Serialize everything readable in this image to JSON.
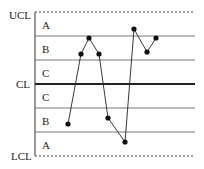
{
  "chart_data": {
    "type": "line",
    "title": "",
    "xlabel": "",
    "ylabel": "",
    "control_lines": [
      {
        "name": "UCL",
        "y": 12,
        "style": "dashed"
      },
      {
        "name": "CL",
        "y": 84,
        "style": "thick"
      },
      {
        "name": "LCL",
        "y": 156,
        "style": "dashed"
      }
    ],
    "zone_lines_y": [
      36,
      60,
      108,
      132
    ],
    "zones": [
      {
        "label": "A",
        "y": 25
      },
      {
        "label": "B",
        "y": 49
      },
      {
        "label": "C",
        "y": 73
      },
      {
        "label": "C",
        "y": 97
      },
      {
        "label": "B",
        "y": 121
      },
      {
        "label": "A",
        "y": 145
      }
    ],
    "points": [
      {
        "x": 68,
        "y": 124
      },
      {
        "x": 81,
        "y": 54
      },
      {
        "x": 89,
        "y": 38
      },
      {
        "x": 99,
        "y": 54
      },
      {
        "x": 108,
        "y": 118
      },
      {
        "x": 125,
        "y": 142
      },
      {
        "x": 134,
        "y": 29
      },
      {
        "x": 147,
        "y": 52
      },
      {
        "x": 156,
        "y": 38
      }
    ],
    "sequence_values_sigma": [
      -1.8,
      1.4,
      2.1,
      1.4,
      -1.5,
      -2.6,
      2.5,
      1.5,
      2.1
    ],
    "ylim_sigma": [
      -3,
      3
    ],
    "grid": false,
    "legend": "none"
  },
  "labels": {
    "ucl": "UCL",
    "cl": "CL",
    "lcl": "LCL",
    "zone_a_top": "A",
    "zone_b_top": "B",
    "zone_c_top": "C",
    "zone_c_bottom": "C",
    "zone_b_bottom": "B",
    "zone_a_bottom": "A"
  },
  "colors": {
    "line": "#222222",
    "zone_line": "#555555",
    "background": "#ffffff"
  }
}
